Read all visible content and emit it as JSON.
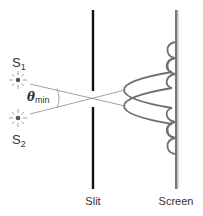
{
  "diagram": {
    "labels": {
      "source1": "S",
      "source1_sub": "1",
      "source2": "S",
      "source2_sub": "2",
      "angle": "θ",
      "angle_sub": "min",
      "slit": "Slit",
      "screen": "Screen"
    },
    "icons": {
      "source1": "point-source-star-icon",
      "source2": "point-source-star-icon"
    },
    "colors": {
      "background": "#ffffff",
      "slit": "#111111",
      "screen": "#777777",
      "screen_highlight": "#bbbbbb",
      "rays": "#888888",
      "intensity_curves": "#707070",
      "source_core": "#555555",
      "source_rays": "#999999",
      "text": "#333333"
    }
  }
}
